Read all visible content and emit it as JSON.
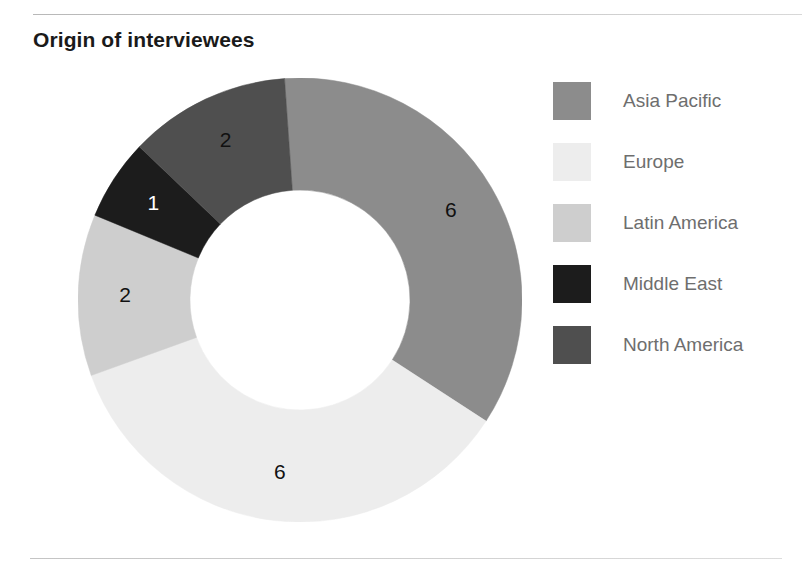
{
  "chart_title": "Origin of interviewees",
  "chart_data": {
    "type": "pie",
    "variant": "donut",
    "title": "Origin of interviewees",
    "categories": [
      "Asia Pacific",
      "Europe",
      "Latin America",
      "Middle East",
      "North America"
    ],
    "values": [
      6,
      6,
      2,
      1,
      2
    ],
    "total": 17,
    "data_labels": [
      "6",
      "6",
      "2",
      "1",
      "2"
    ],
    "colors": [
      "#8c8c8c",
      "#ededed",
      "#cecece",
      "#1c1c1c",
      "#4f4f4f"
    ],
    "label_colors": [
      "#111111",
      "#111111",
      "#111111",
      "#ffffff",
      "#111111"
    ],
    "start_angle_deg": -94,
    "legend_position": "right",
    "grid": false,
    "xlabel": "",
    "ylabel": "",
    "series": [
      {
        "name": "Origin of interviewees",
        "values": [
          6,
          6,
          2,
          1,
          2
        ]
      }
    ]
  },
  "legend": {
    "items": [
      {
        "label": "Asia Pacific",
        "color": "#8c8c8c",
        "value": "6"
      },
      {
        "label": "Europe",
        "color": "#ededed",
        "value": "6"
      },
      {
        "label": "Latin America",
        "color": "#cecece",
        "value": "2"
      },
      {
        "label": "Middle East",
        "color": "#1c1c1c",
        "value": "1"
      },
      {
        "label": "North America",
        "color": "#4f4f4f",
        "value": "2"
      }
    ]
  },
  "slice_labels": {
    "asia_pacific": "6",
    "europe": "6",
    "latin_america": "2",
    "middle_east": "1",
    "north_america": "2"
  }
}
